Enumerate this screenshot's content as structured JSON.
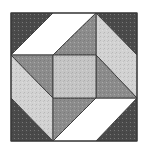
{
  "image": {
    "subject": "quilt-block",
    "background": "#ffffff",
    "outline_color": "#3a3a3a",
    "bounds": {
      "x": 11,
      "y": 13,
      "w": 126,
      "h": 128
    }
  },
  "palette": {
    "dark": "#4a4a4a",
    "mid": "#8c8c8c",
    "light": "#d2d2d2",
    "center": "#c4c4c4",
    "white": "#ffffff"
  },
  "pieces": [
    {
      "name": "corner-triangle-top-left",
      "fill": "dark",
      "points": "11,13 53,13 11,55"
    },
    {
      "name": "corner-triangle-top-right",
      "fill": "dark",
      "points": "96,13 137,13 137,55"
    },
    {
      "name": "corner-triangle-bottom-right",
      "fill": "dark",
      "points": "137,98 137,141 96,141"
    },
    {
      "name": "corner-triangle-bottom-left",
      "fill": "dark",
      "points": "11,98 11,141 53,141"
    },
    {
      "name": "parallelogram-top-white",
      "fill": "white",
      "points": "53,13 96,13 53,55 11,55"
    },
    {
      "name": "parallelogram-right-light",
      "fill": "light",
      "points": "96,13 137,55 137,98 96,55"
    },
    {
      "name": "parallelogram-bottom-white",
      "fill": "white",
      "points": "96,98 137,98 96,141 53,141"
    },
    {
      "name": "parallelogram-left-light",
      "fill": "light",
      "points": "11,55 53,98 53,141 11,98"
    },
    {
      "name": "triangle-top-mid",
      "fill": "mid",
      "points": "96,13 96,55 53,55"
    },
    {
      "name": "triangle-right-mid",
      "fill": "mid",
      "points": "96,55 137,98 96,98"
    },
    {
      "name": "triangle-bottom-mid",
      "fill": "mid",
      "points": "53,98 96,98 53,141"
    },
    {
      "name": "triangle-left-mid",
      "fill": "mid",
      "points": "11,55 53,55 53,98"
    },
    {
      "name": "center-square",
      "fill": "center",
      "points": "53,55 96,55 96,98 53,98"
    }
  ]
}
